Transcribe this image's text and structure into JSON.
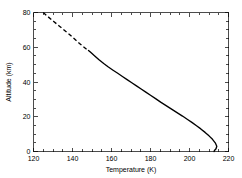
{
  "chart_data": {
    "type": "line",
    "title": "",
    "xlabel": "Temperature (K)",
    "ylabel": "Altitude (km)",
    "xlim": [
      120,
      220
    ],
    "ylim": [
      0,
      80
    ],
    "xticks": [
      120,
      140,
      160,
      180,
      200,
      220
    ],
    "yticks": [
      0,
      20,
      40,
      60,
      80
    ],
    "xtick_labels": [
      "120",
      "140",
      "160",
      "180",
      "200",
      "220"
    ],
    "ytick_labels": [
      "0",
      "20",
      "40",
      "60",
      "80"
    ],
    "x_minor_interval": 5,
    "y_minor_interval": 5,
    "grid": false,
    "legend": null,
    "legend_position": "none",
    "line_color": "#000000",
    "background_color": "#ffffff",
    "series": [
      {
        "name": "temperature-profile-upper",
        "style": "dashed",
        "comment": "Upper atmosphere branch, drawn dashed from 80 km down to ~58 km",
        "x": [
          125.0,
          127.5,
          130.2,
          133.0,
          135.8,
          138.6,
          141.2,
          143.6,
          145.6,
          147.2,
          148.2
        ],
        "y": [
          80.0,
          77.5,
          75.0,
          72.4,
          69.8,
          67.2,
          64.6,
          62.2,
          60.3,
          58.9,
          58.2
        ]
      },
      {
        "name": "temperature-profile-lower",
        "style": "solid",
        "comment": "Lower atmosphere branch, solid from ~58 km down to the surface with a near-surface hook",
        "x": [
          148.2,
          149.0,
          150.0,
          151.4,
          153.6,
          156.0,
          158.4,
          160.8,
          163.2,
          165.6,
          168.0,
          170.4,
          172.8,
          175.2,
          177.6,
          180.0,
          182.6,
          185.2,
          188.0,
          190.8,
          193.6,
          196.4,
          199.0,
          201.4,
          203.6,
          205.8,
          208.0,
          210.0,
          211.8,
          213.2,
          214.0,
          213.6,
          212.8,
          212.6
        ],
        "y": [
          58.2,
          57.4,
          56.4,
          55.0,
          52.8,
          50.6,
          48.6,
          46.8,
          45.0,
          43.2,
          41.4,
          39.6,
          37.8,
          36.0,
          34.2,
          32.4,
          30.4,
          28.4,
          26.4,
          24.4,
          22.4,
          20.4,
          18.4,
          16.6,
          14.8,
          13.0,
          11.0,
          9.0,
          7.0,
          5.0,
          3.0,
          1.6,
          0.6,
          0.0
        ]
      }
    ]
  }
}
